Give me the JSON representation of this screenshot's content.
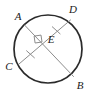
{
  "figure": {
    "kind": "geometry-diagram",
    "width": 93,
    "height": 95,
    "background_color": "#ffffff"
  },
  "colors": {
    "circle_stroke": "#2b2b2b",
    "chord_stroke": "#8c8c8c",
    "tick_stroke": "#8c8c8c",
    "right_angle_stroke": "#8c8c8c",
    "label_fill": "#1a1a1a"
  },
  "circle": {
    "name": "circle",
    "center_x": 48,
    "center_y": 49,
    "radius": 34,
    "stroke_width": 1.7
  },
  "points": {
    "A": {
      "label": "A",
      "x": 24.5,
      "y": 25.0,
      "label_x": 18,
      "label_y": 17
    },
    "B": {
      "label": "B",
      "x": 73.5,
      "y": 76.5,
      "label_x": 80,
      "label_y": 86
    },
    "C": {
      "label": "C",
      "x": 19.0,
      "y": 64.0,
      "label_x": 9,
      "label_y": 67
    },
    "D": {
      "label": "D",
      "x": 70.5,
      "y": 20.0,
      "label_x": 73,
      "label_y": 10
    },
    "E": {
      "label": "E",
      "x": 42.0,
      "y": 42.0,
      "label_x": 51,
      "label_y": 40
    }
  },
  "chords": [
    {
      "name": "chord-AB",
      "label": "AB",
      "from": "A",
      "to": "B",
      "x1": 24.5,
      "y1": 25.0,
      "x2": 73.5,
      "y2": 76.5,
      "stroke_width": 1.0
    },
    {
      "name": "chord-CD",
      "label": "CD",
      "from": "C",
      "to": "D",
      "x1": 19.0,
      "y1": 64.0,
      "x2": 70.5,
      "y2": 20.0,
      "stroke_width": 1.0
    }
  ],
  "tick_marks": [
    {
      "name": "tick-segment-CE",
      "on_segment": "CE",
      "count": 1,
      "cx": 30.5,
      "cy": 54.3,
      "x1": 26.6,
      "y1": 50.8,
      "x2": 34.4,
      "y2": 57.8
    },
    {
      "name": "tick-segment-ED",
      "on_segment": "ED",
      "count": 1,
      "cx": 56.2,
      "cy": 30.3,
      "x1": 52.3,
      "y1": 26.8,
      "x2": 60.1,
      "y2": 33.8
    }
  ],
  "right_angle_mark": {
    "name": "right-angle-at-E",
    "at_point": "E",
    "size": 8,
    "points": "42.0,42.0 35.1,43.0 34.1,36.1 41.0,35.1"
  },
  "annotations": {
    "intersection_point": "E",
    "perpendicular": true,
    "equal_segments": [
      "CE",
      "ED"
    ]
  }
}
